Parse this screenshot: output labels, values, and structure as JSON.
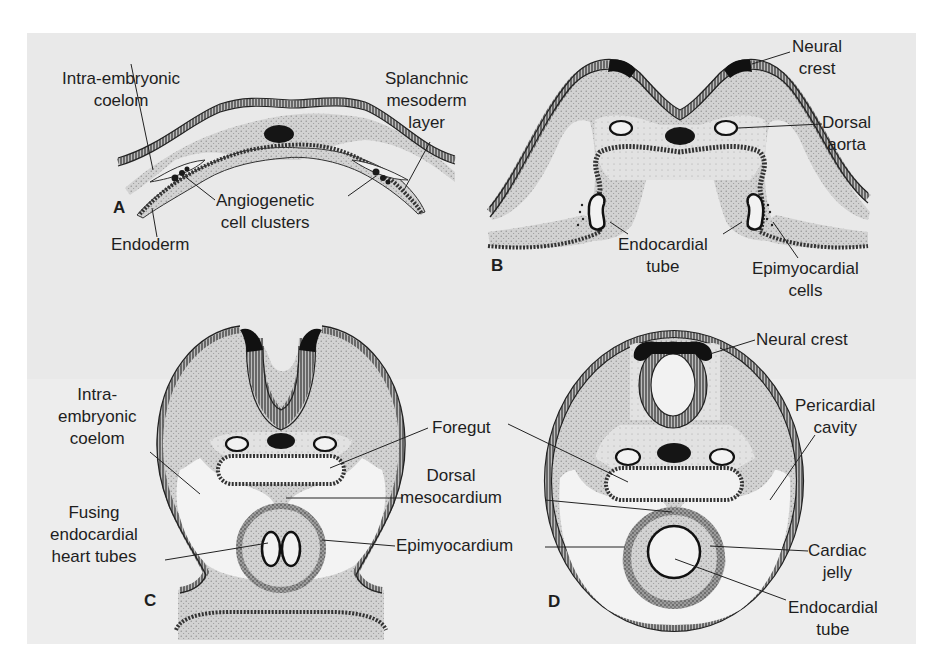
{
  "figure": {
    "panels": [
      {
        "id": "A",
        "letter": "A",
        "labels": {
          "intra_embryonic_coelom": "Intra-embryonic\ncoelom",
          "splanchnic_mesoderm_layer": "Splanchnic\nmesoderm\nlayer",
          "angiogenetic_cell_clusters": "Angiogenetic\ncell clusters",
          "endoderm": "Endoderm"
        }
      },
      {
        "id": "B",
        "letter": "B",
        "labels": {
          "neural_crest": "Neural\ncrest",
          "dorsal_aorta": "Dorsal\naorta",
          "endocardial_tube": "Endocardial\ntube",
          "epimyocardial_cells": "Epimyocardial\ncells"
        }
      },
      {
        "id": "C",
        "letter": "C",
        "labels": {
          "intra_embryonic_coelom": "Intra-\nembryonic\ncoelom",
          "fusing_endocardial_heart_tubes": "Fusing\nendocardial\nheart tubes",
          "foregut": "Foregut",
          "dorsal_mesocardium": "Dorsal\nmesocardium",
          "epimyocardium": "Epimyocardium"
        }
      },
      {
        "id": "D",
        "letter": "D",
        "labels": {
          "neural_crest": "Neural crest",
          "pericardial_cavity": "Pericardial\ncavity",
          "cardiac_jelly": "Cardiac\njelly",
          "endocardial_tube": "Endocardial\ntube"
        }
      }
    ]
  },
  "colors": {
    "background": "#ffffff",
    "panel": "#e9e9e9",
    "tissue_fill": "#cfcfcf",
    "ink": "#1e1e1e",
    "dark_mass": "#1a1a1a"
  }
}
